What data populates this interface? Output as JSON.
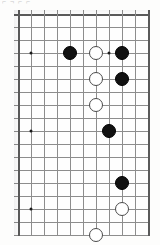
{
  "caption": {
    "text": "⌐ ¬ ⌐ ⌐"
  },
  "board": {
    "title": "go-board-diagram",
    "columns": 11,
    "rows": 19,
    "cell_size": 13,
    "origin": {
      "x": 4,
      "y": 4
    },
    "line_color": "#8d8d8d",
    "edge_color": "#5a5a5a",
    "black_color": "#111111",
    "white_color": "#ffffff",
    "stone_radius": 7,
    "star_points": [
      {
        "col": 1,
        "row": 3
      },
      {
        "col": 1,
        "row": 9
      },
      {
        "col": 1,
        "row": 15
      },
      {
        "col": 7,
        "row": 3
      }
    ],
    "stones": [
      {
        "color": "black",
        "col": 4,
        "row": 3
      },
      {
        "color": "white",
        "col": 6,
        "row": 3
      },
      {
        "color": "black",
        "col": 8,
        "row": 3
      },
      {
        "color": "white",
        "col": 6,
        "row": 5
      },
      {
        "color": "black",
        "col": 8,
        "row": 5
      },
      {
        "color": "white",
        "col": 6,
        "row": 7
      },
      {
        "color": "black",
        "col": 7,
        "row": 9
      },
      {
        "color": "black",
        "col": 8,
        "row": 13
      },
      {
        "color": "white",
        "col": 8,
        "row": 15
      },
      {
        "color": "white",
        "col": 6,
        "row": 17
      }
    ]
  }
}
